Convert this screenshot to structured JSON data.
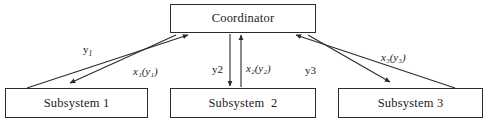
{
  "diagram": {
    "stroke_color": "#2b2b2b",
    "background": "#ffffff",
    "nodes": [
      {
        "id": "coordinator",
        "label": "Coordinator"
      },
      {
        "id": "subsystem1",
        "label": "Subsystem 1"
      },
      {
        "id": "subsystem2",
        "label": "Subsystem  2"
      },
      {
        "id": "subsystem3",
        "label": "Subsystem 3"
      }
    ],
    "edge_labels": {
      "y1": {
        "base": "y",
        "sub": "1",
        "style": "upright"
      },
      "x1": {
        "base": "x",
        "sub": "1",
        "arg_base": "y",
        "arg_sub": "1",
        "text": "x₁(y₁)",
        "style": "italic"
      },
      "y2": {
        "base": "y",
        "sub": "2",
        "text": "y2",
        "style": "upright"
      },
      "x2": {
        "base": "x",
        "sub": "2",
        "arg_base": "y",
        "arg_sub": "2",
        "text": "x₂(y₂)",
        "style": "italic"
      },
      "y3": {
        "base": "y",
        "sub": "3",
        "text": "y3",
        "style": "upright"
      },
      "x3": {
        "base": "x",
        "sub": "3",
        "arg_base": "y",
        "arg_sub": "3",
        "text": "x₃(y₃)",
        "style": "italic"
      }
    },
    "edges": [
      {
        "from": "subsystem1",
        "to": "coordinator",
        "label": "y1",
        "direction": "up"
      },
      {
        "from": "coordinator",
        "to": "subsystem1",
        "label": "x1",
        "direction": "down"
      },
      {
        "from": "subsystem2",
        "to": "coordinator",
        "label": "y2",
        "direction": "up"
      },
      {
        "from": "coordinator",
        "to": "subsystem2",
        "label": "x2",
        "direction": "down"
      },
      {
        "from": "subsystem3",
        "to": "coordinator",
        "label": "y3",
        "direction": "up"
      },
      {
        "from": "coordinator",
        "to": "subsystem3",
        "label": "x3",
        "direction": "down"
      }
    ],
    "caption_fragment": ""
  }
}
